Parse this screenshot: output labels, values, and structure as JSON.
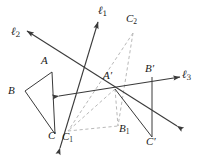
{
  "figure": {
    "width": 206,
    "height": 161,
    "background_color": "#ffffff",
    "stroke_color": "#3a3a3a",
    "dashed_color": "#b9b9b9",
    "label_color": "#1a1a1a"
  },
  "labels": {
    "line_l1": "ℓ",
    "line_l1_sub": "1",
    "line_l2": "ℓ",
    "line_l2_sub": "2",
    "line_l3": "ℓ",
    "line_l3_sub": "3",
    "vertex_A": "A",
    "vertex_B": "B",
    "vertex_C": "C",
    "vertex_A_prime": "A′",
    "vertex_B_prime": "B′",
    "vertex_C_prime": "C′",
    "vertex_B1": "B",
    "vertex_B1_sub": "1",
    "vertex_C1": "C",
    "vertex_C1_sub": "1",
    "vertex_C2": "C",
    "vertex_C2_sub": "2"
  },
  "points": {
    "A": {
      "x": 52,
      "y": 72
    },
    "B": {
      "x": 25,
      "y": 91
    },
    "C": {
      "x": 55,
      "y": 134
    },
    "A_prime": {
      "x": 115,
      "y": 89
    },
    "B_prime": {
      "x": 152,
      "y": 77
    },
    "C_prime": {
      "x": 152,
      "y": 137
    },
    "B1": {
      "x": 118,
      "y": 126
    },
    "C1": {
      "x": 68,
      "y": 131
    },
    "C2": {
      "x": 133,
      "y": 33
    }
  },
  "label_positions": {
    "l1": {
      "x": 98,
      "y": 5
    },
    "l2": {
      "x": 11,
      "y": 26
    },
    "l3": {
      "x": 182,
      "y": 69
    },
    "A": {
      "x": 41,
      "y": 55
    },
    "B": {
      "x": 8,
      "y": 85
    },
    "C": {
      "x": 48,
      "y": 136
    },
    "A_prime": {
      "x": 103,
      "y": 71
    },
    "B_prime": {
      "x": 146,
      "y": 64
    },
    "C_prime": {
      "x": 147,
      "y": 138
    },
    "B1": {
      "x": 120,
      "y": 124
    },
    "C1": {
      "x": 63,
      "y": 136
    },
    "C2": {
      "x": 127,
      "y": 14
    }
  },
  "arrow_tips": {
    "l1_up": {
      "x": 98,
      "y": 22
    },
    "l1_down": {
      "x": 60,
      "y": 148
    },
    "l2_up": {
      "x": 27,
      "y": 31
    },
    "l2_down": {
      "x": 177,
      "y": 126
    },
    "l3_right": {
      "x": 180,
      "y": 77
    },
    "l3_left": {
      "x": 59,
      "y": 96
    }
  }
}
